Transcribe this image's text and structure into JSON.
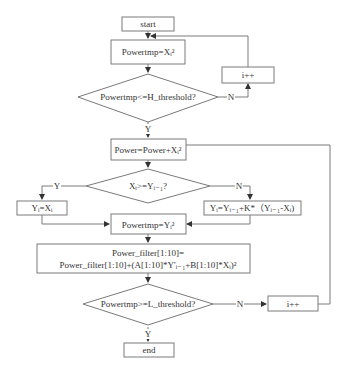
{
  "flowchart": {
    "nodes": {
      "start": "start",
      "powertmp_x": "Powertmp=Xᵢ²",
      "h_threshold": "Powertmp<=H_threshold?",
      "i_inc_top": "i++",
      "power_add": "Power=Power+Xᵢ²",
      "compare": "Xᵢ>=Yᵢ₋₁?",
      "y_eq_x": "Yᵢ=Xᵢ",
      "y_update": "Yᵢ=Yᵢ₋₁+K*（Yᵢ₋₁-Xᵢ)",
      "powertmp_y": "Powertmp=Yᵢ²",
      "filter_line1": "Power_filter[1:10]=",
      "filter_line2": "Power_filter[1:10]+(A[1:10]*Y'ᵢ₋₁+B[1:10]*Xᵢ)²",
      "l_threshold": "Powertmp>=L_threshold?",
      "i_inc_bottom": "i++",
      "end": "end"
    },
    "edge_labels": {
      "h_no": "N",
      "h_yes": "Y",
      "cmp_yes": "Y",
      "cmp_no": "N",
      "l_no": "N",
      "l_yes": "Y"
    }
  }
}
